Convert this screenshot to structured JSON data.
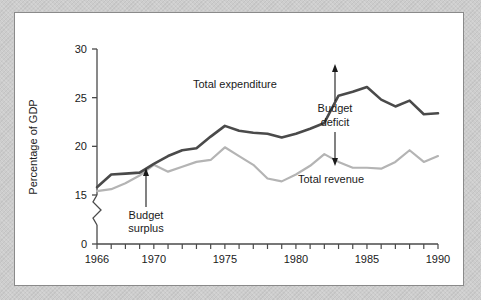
{
  "figure": {
    "panel_background": "#ffffff",
    "page_background": "#cdcdcd",
    "border_color": "#8a8a8a"
  },
  "chart_data": {
    "type": "line",
    "title": "",
    "subtitle": "",
    "xlabel": "",
    "ylabel": "Percentage of GDP",
    "xlim": [
      1966,
      1990
    ],
    "ylim": [
      15,
      30
    ],
    "ylim_display": [
      0,
      30
    ],
    "y_axis_break": true,
    "y_break_between": [
      0,
      15
    ],
    "grid": false,
    "legend_position": "inline-annotation",
    "xticks": [
      1966,
      1967,
      1968,
      1969,
      1970,
      1971,
      1972,
      1973,
      1974,
      1975,
      1976,
      1977,
      1978,
      1979,
      1980,
      1981,
      1982,
      1983,
      1984,
      1985,
      1986,
      1987,
      1988,
      1989,
      1990
    ],
    "xtick_labels_shown": [
      "1966",
      "1970",
      "1975",
      "1980",
      "1985",
      "1990"
    ],
    "xtick_labels_shown_values": [
      1966,
      1970,
      1975,
      1980,
      1985,
      1990
    ],
    "yticks": [
      0,
      15,
      20,
      25,
      30
    ],
    "ytick_labels": [
      "0",
      "15",
      "20",
      "25",
      "30"
    ],
    "x": [
      1966,
      1967,
      1968,
      1969,
      1970,
      1971,
      1972,
      1973,
      1974,
      1975,
      1976,
      1977,
      1978,
      1979,
      1980,
      1981,
      1982,
      1983,
      1984,
      1985,
      1986,
      1987,
      1988,
      1989,
      1990
    ],
    "series": [
      {
        "name": "Total expenditure",
        "color": "#4a4a4a",
        "width": 2.6,
        "values": [
          15.8,
          17.1,
          17.2,
          17.3,
          18.2,
          19.0,
          19.6,
          19.8,
          21.0,
          22.1,
          21.6,
          21.4,
          21.3,
          20.9,
          21.3,
          21.8,
          22.4,
          25.2,
          25.6,
          26.1,
          24.8,
          24.1,
          24.7,
          23.3,
          23.4
        ],
        "values_1990": 23.3
      },
      {
        "name": "Total revenue",
        "color": "#b4b4b4",
        "width": 2.2,
        "values": [
          15.4,
          15.6,
          16.2,
          17.0,
          18.1,
          17.4,
          17.9,
          18.4,
          18.6,
          19.9,
          19.0,
          18.1,
          16.7,
          16.4,
          17.1,
          18.0,
          19.2,
          18.4,
          17.8,
          17.8,
          17.7,
          18.4,
          19.6,
          18.4,
          19.0
        ],
        "values_1990": 19.1
      }
    ],
    "annotations": [
      {
        "id": "budget-surplus",
        "text_lines": [
          "Budget",
          "surplus"
        ],
        "text": "Budget surplus",
        "arrow_points_to_year": 1969,
        "arrow_points_to_value": 17.25,
        "arrow_direction": "up"
      },
      {
        "id": "budget-deficit",
        "text_lines": [
          "Budget",
          "deficit"
        ],
        "text": "Budget deficit",
        "arrow_points_to_year": 1983.5,
        "arrow_top_value": 26.1,
        "arrow_bottom_value": 17.8,
        "arrow_direction": "both"
      }
    ],
    "series_inline_labels": [
      {
        "text": "Total expenditure",
        "near_year": 1977,
        "near_value": 23.4
      },
      {
        "text": "Total revenue",
        "near_year": 1982.5,
        "near_value": 16.5
      }
    ]
  }
}
